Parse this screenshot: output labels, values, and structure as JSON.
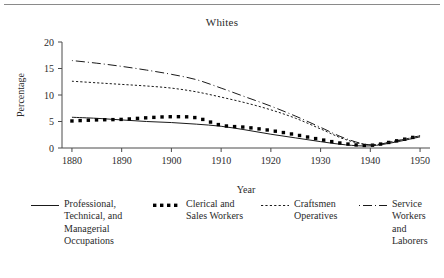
{
  "figure": {
    "title": "Whites",
    "top_rule": true
  },
  "axes": {
    "y_axis_label": "Percentage",
    "x_axis_label": "Year",
    "y_ticks": [
      "0",
      "5",
      "10",
      "15",
      "20"
    ],
    "x_ticks": [
      "1880",
      "1890",
      "1900",
      "1910",
      "1920",
      "1930",
      "1940",
      "1950"
    ],
    "line_color": "#4a4a4a",
    "text_color": "#2b2b2b"
  },
  "legend": {
    "entries": [
      {
        "label": "Professional,\nTechnical, and\nManagerial\nOccupations",
        "style": "solid",
        "icon": "solid-line-icon"
      },
      {
        "label": "Clerical and\nSales Workers",
        "style": "square-dots",
        "icon": "square-dotted-line-icon"
      },
      {
        "label": "Craftsmen\nOperatives",
        "style": "fine-dotted",
        "icon": "fine-dotted-line-icon"
      },
      {
        "label": "Service\nWorkers and\nLaborers",
        "style": "dash-dot",
        "icon": "dash-dot-line-icon"
      }
    ]
  },
  "chart_data": {
    "type": "line",
    "title": "Whites",
    "xlabel": "Year",
    "ylabel": "Percentage",
    "xlim": [
      1878,
      1952
    ],
    "ylim": [
      0,
      20
    ],
    "grid": false,
    "legend_position": "below",
    "x": [
      1880,
      1885,
      1890,
      1895,
      1900,
      1905,
      1910,
      1915,
      1920,
      1925,
      1930,
      1935,
      1940,
      1945,
      1950
    ],
    "series": [
      {
        "name": "Professional, Technical, and Managerial Occupations",
        "style": "solid",
        "color": "#1a1a1a",
        "values": [
          5.8,
          5.6,
          5.3,
          5.0,
          4.8,
          4.5,
          4.1,
          3.4,
          2.6,
          1.9,
          1.2,
          0.6,
          0.4,
          1.1,
          2.1
        ]
      },
      {
        "name": "Clerical and Sales Workers",
        "style": "square-dots",
        "color": "#000000",
        "values": [
          5.1,
          5.3,
          5.4,
          5.7,
          5.9,
          5.7,
          4.3,
          3.9,
          3.3,
          2.5,
          1.6,
          0.8,
          0.5,
          1.3,
          2.3
        ]
      },
      {
        "name": "Craftsmen Operatives",
        "style": "fine-dotted",
        "color": "#1a1a1a",
        "values": [
          12.6,
          12.3,
          12.0,
          11.7,
          11.3,
          10.6,
          9.6,
          8.5,
          7.2,
          5.6,
          3.6,
          1.6,
          0.6,
          1.3,
          2.3
        ]
      },
      {
        "name": "Service Workers and Laborers",
        "style": "dash-dot",
        "color": "#1a1a1a",
        "values": [
          16.5,
          16.0,
          15.4,
          14.7,
          13.9,
          12.9,
          11.3,
          9.6,
          7.9,
          6.0,
          3.9,
          1.8,
          0.6,
          1.3,
          2.3
        ]
      }
    ]
  }
}
